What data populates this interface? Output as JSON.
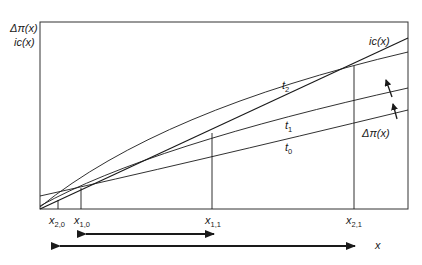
{
  "axes": {
    "y_label_line1": "Δπ(x)",
    "y_label_line2": "ic(x)",
    "x_label": "x"
  },
  "curves": {
    "ic": "ic(x)",
    "t2": "t",
    "t2_sub": "2",
    "t1": "t",
    "t1_sub": "1",
    "t0": "t",
    "t0_sub": "0",
    "dpi": "Δπ(x)"
  },
  "ticks": [
    {
      "base": "x",
      "sub": "2,0"
    },
    {
      "base": "x",
      "sub": "1,0"
    },
    {
      "base": "x",
      "sub": "1,1"
    },
    {
      "base": "x",
      "sub": "2,1"
    }
  ],
  "colors": {
    "line": "#1a1a1a",
    "frame": "#333333",
    "background": "#ffffff"
  }
}
